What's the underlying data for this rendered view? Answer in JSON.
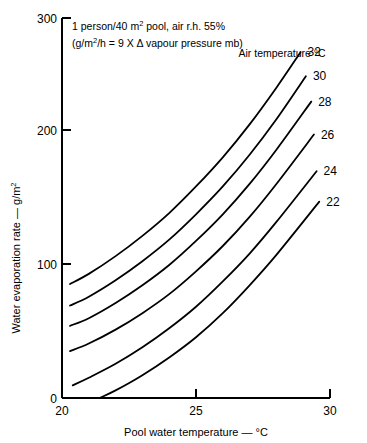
{
  "chart_data": {
    "type": "line",
    "title": "",
    "xlabel": "Pool water temperature — °C",
    "ylabel": "Water evaporation rate — g/m²",
    "xlim": [
      20,
      30
    ],
    "ylim": [
      0,
      300
    ],
    "xticks": [
      20,
      25,
      30
    ],
    "yticks": [
      0,
      100,
      200,
      300
    ],
    "xtick_labels": [
      "20",
      "25",
      "30"
    ],
    "ytick_labels": [
      "0",
      "100",
      "200",
      "300"
    ],
    "grid": false,
    "legend_position": "right-inline",
    "legend_title": "Air temperature °C",
    "annotations": [
      "1 person/40 m² pool, air r.h. 55%",
      "(g/m²/h = 9 X Δ vapour pressure mb)"
    ],
    "series": [
      {
        "name": "32",
        "label": "32",
        "x": [
          20.3,
          21.0,
          22.0,
          23.0,
          24.0,
          25.0,
          26.0,
          27.0,
          28.0,
          28.9
        ],
        "values": [
          90,
          98,
          112,
          128,
          146,
          167,
          190,
          216,
          245,
          273
        ]
      },
      {
        "name": "30",
        "label": "30",
        "x": [
          20.3,
          21.0,
          22.0,
          23.0,
          24.0,
          25.0,
          26.0,
          27.0,
          28.0,
          29.1
        ],
        "values": [
          73,
          80,
          93,
          108,
          125,
          145,
          167,
          192,
          220,
          254
        ]
      },
      {
        "name": "28",
        "label": "28",
        "x": [
          20.3,
          21.0,
          22.0,
          23.0,
          24.0,
          25.0,
          26.0,
          27.0,
          28.0,
          29.3
        ],
        "values": [
          57,
          63,
          75,
          89,
          105,
          124,
          145,
          169,
          196,
          234
        ]
      },
      {
        "name": "26",
        "label": "26",
        "x": [
          20.3,
          21.0,
          22.0,
          23.0,
          24.0,
          25.0,
          26.0,
          27.0,
          28.0,
          29.4
        ],
        "values": [
          37,
          43,
          54,
          67,
          82,
          100,
          120,
          143,
          169,
          208
        ]
      },
      {
        "name": "24",
        "label": "24",
        "x": [
          20.4,
          21.0,
          22.0,
          23.0,
          24.0,
          25.0,
          26.0,
          27.0,
          28.0,
          29.5
        ],
        "values": [
          10,
          16,
          27,
          40,
          55,
          72,
          92,
          114,
          139,
          179
        ]
      },
      {
        "name": "22",
        "label": "22",
        "x": [
          21.4,
          22.0,
          23.0,
          24.0,
          25.0,
          26.0,
          27.0,
          28.0,
          29.6
        ],
        "values": [
          0,
          6,
          18,
          32,
          48,
          67,
          89,
          113,
          155
        ]
      }
    ]
  },
  "labels": {
    "legend_title": "Air temperature °C",
    "annotation_line1_pre": "1 person/40 m",
    "annotation_line1_sup": "2",
    "annotation_line1_post": " pool, air r.h. 55%",
    "annotation_line2_pre": "(g/m",
    "annotation_line2_sup": "2",
    "annotation_line2_post": "/h = 9 X Δ vapour pressure mb)",
    "ylabel_pre": "Water evaporation rate — g/m",
    "ylabel_sup": "2",
    "xlabel": "Pool water temperature — °C"
  }
}
